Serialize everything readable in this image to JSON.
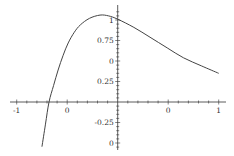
{
  "chart_data": {
    "type": "line",
    "title": "",
    "xlabel": "",
    "ylabel": "",
    "xlim": [
      -1.05,
      1.07
    ],
    "ylim": [
      -0.6,
      1.18
    ],
    "grid": false,
    "legend": null,
    "axes_origin": [
      0,
      0
    ],
    "x_ticks": [
      {
        "value": -1,
        "label": "-1"
      },
      {
        "value": -0.5,
        "label": "0"
      },
      {
        "value": 0.5,
        "label": "0"
      },
      {
        "value": 1,
        "label": "1"
      }
    ],
    "y_ticks": [
      {
        "value": 1,
        "label": "1"
      },
      {
        "value": 0.75,
        "label": "0.75"
      },
      {
        "value": 0.5,
        "label": "0"
      },
      {
        "value": 0.25,
        "label": "0.25"
      },
      {
        "value": -0.25,
        "label": "-0.25"
      },
      {
        "value": -0.5,
        "label": "0"
      }
    ],
    "series": [
      {
        "name": "f(x)",
        "color": "#444444",
        "x": [
          -0.75,
          -0.715,
          -0.68,
          -0.635,
          -0.59,
          -0.54,
          -0.49,
          -0.43,
          -0.37,
          -0.28,
          -0.175,
          -0.09,
          0,
          0.16,
          0.32,
          0.49,
          0.65,
          0.83,
          1.0
        ],
        "y": [
          -0.545,
          -0.27,
          0.0,
          0.2,
          0.39,
          0.57,
          0.72,
          0.85,
          0.94,
          1.02,
          1.06,
          1.05,
          1.01,
          0.91,
          0.79,
          0.66,
          0.54,
          0.44,
          0.35
        ]
      }
    ]
  },
  "colors": {
    "axis": "#333333",
    "curve": "#444444",
    "background": "#ffffff"
  }
}
